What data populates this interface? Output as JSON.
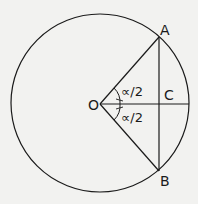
{
  "diagram": {
    "type": "geometry",
    "labels": {
      "A": "A",
      "B": "B",
      "C": "C",
      "O": "O",
      "angle_upper": "∝/2",
      "angle_lower": "∝/2"
    },
    "colors": {
      "stroke": "#1a1a1a",
      "background": "#f2f2f0"
    }
  }
}
